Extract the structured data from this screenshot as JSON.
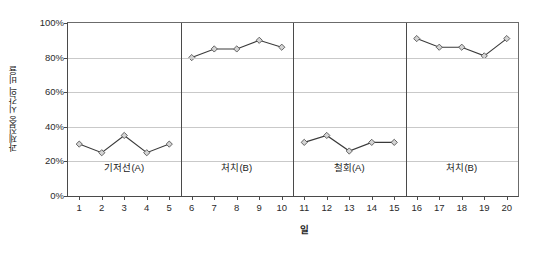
{
  "chart_data": {
    "type": "line",
    "title": "",
    "subtitle": "",
    "xlabel": "일",
    "ylabel": "과제집중 시간의 비율",
    "xlim": [
      0.5,
      20.5
    ],
    "ylim": [
      0,
      100
    ],
    "grid": true,
    "legend": "none",
    "y_tick_labels": [
      "100%",
      "80%",
      "60%",
      "40%",
      "20%",
      "0%"
    ],
    "y_tick_values": [
      100,
      80,
      60,
      40,
      20,
      0
    ],
    "x_tick_labels": [
      "1",
      "2",
      "3",
      "4",
      "5",
      "6",
      "7",
      "8",
      "9",
      "10",
      "11",
      "12",
      "13",
      "14",
      "15",
      "16",
      "17",
      "18",
      "19",
      "20"
    ],
    "x": [
      1,
      2,
      3,
      4,
      5,
      6,
      7,
      8,
      9,
      10,
      11,
      12,
      13,
      14,
      15,
      16,
      17,
      18,
      19,
      20
    ],
    "phase_dividers_x": [
      5.5,
      10.5,
      15.5
    ],
    "marker_style": "diamond",
    "line_color": "#3a3a3a",
    "marker_fill": "#d4d4d4",
    "marker_edge": "#555555",
    "phases": [
      {
        "label": "기저선(A)",
        "center_x": 3,
        "x": [
          1,
          2,
          3,
          4,
          5
        ],
        "values": [
          30,
          25,
          35,
          25,
          30
        ]
      },
      {
        "label": "처치(B)",
        "center_x": 8,
        "x": [
          6,
          7,
          8,
          9,
          10
        ],
        "values": [
          80,
          85,
          85,
          90,
          86
        ]
      },
      {
        "label": "철회(A)",
        "center_x": 13,
        "x": [
          11,
          12,
          13,
          14,
          15
        ],
        "values": [
          31,
          35,
          26,
          31,
          31
        ]
      },
      {
        "label": "처치(B)",
        "center_x": 18,
        "x": [
          16,
          17,
          18,
          19,
          20
        ],
        "values": [
          91,
          86,
          86,
          81,
          91
        ]
      }
    ],
    "series": [
      {
        "name": "과제집중 시간의 비율",
        "values": [
          30,
          25,
          35,
          25,
          30,
          80,
          85,
          85,
          90,
          86,
          31,
          35,
          26,
          31,
          31,
          91,
          86,
          86,
          81,
          91
        ]
      }
    ]
  }
}
